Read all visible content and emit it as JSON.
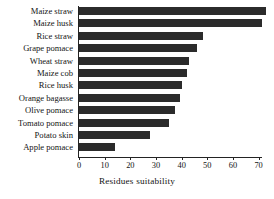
{
  "chart_data": {
    "type": "bar",
    "orientation": "horizontal",
    "title": "",
    "xlabel": "Residues suitability",
    "ylabel": "",
    "categories": [
      "Maize straw",
      "Maize husk",
      "Rice straw",
      "Grape pomace",
      "Wheat straw",
      "Maize cob",
      "Rice husk",
      "Orange bagasse",
      "Olive pomace",
      "Tomato pomace",
      "Potato skin",
      "Apple pomace"
    ],
    "values": [
      73,
      71.5,
      48.5,
      46,
      43,
      42,
      40,
      39.5,
      37.5,
      35,
      27.5,
      14
    ],
    "xlim": [
      0,
      76
    ],
    "xticks": [
      0,
      10,
      20,
      30,
      40,
      50,
      60,
      70
    ],
    "xticklabels": [
      "0",
      "10",
      "20",
      "30",
      "40",
      "50",
      "60",
      "70"
    ],
    "grid": false,
    "legend": false,
    "bar_color": "#2b2b2b",
    "axis_color": "#232323",
    "background_color": "#ffffff"
  }
}
